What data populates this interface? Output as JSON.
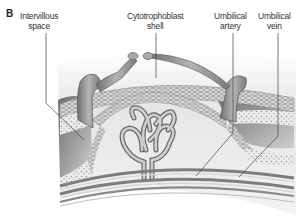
{
  "figure": {
    "panel_letter": "B",
    "labels": [
      {
        "id": "intervillous-space",
        "line1": "Intervillous",
        "line2": "space"
      },
      {
        "id": "cytotrophoblast-shell",
        "line1": "Cytotrophoblast",
        "line2": "shell"
      },
      {
        "id": "umbilical-artery",
        "line1": "Umbilical",
        "line2": "artery"
      },
      {
        "id": "umbilical-vein",
        "line1": "Umbilical",
        "line2": "vein"
      }
    ],
    "colors": {
      "text": "#333333",
      "leader_line": "#444444",
      "villus_fill": "#9a9a9a",
      "intervillous_fill": "#8c8c8c",
      "cell_layer": "#c8c8c8",
      "background_tissue": "#efefef",
      "vessel_band": "#7d7d7d"
    }
  }
}
